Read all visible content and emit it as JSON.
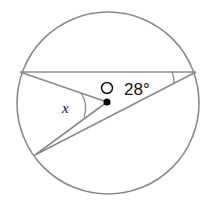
{
  "diagram": {
    "type": "circle-geometry",
    "center_label": "O",
    "angle_label": "28°",
    "unknown_label": "x",
    "colors": {
      "stroke": "#8a8a8a",
      "center_dot": "#000000",
      "text": "#111111"
    },
    "circle": {
      "cx": 108,
      "cy": 103,
      "r": 91
    },
    "points": {
      "A": {
        "x": 20,
        "y": 72
      },
      "B": {
        "x": 196,
        "y": 72
      },
      "C": {
        "x": 35,
        "y": 155
      },
      "O": {
        "x": 107,
        "y": 102
      }
    }
  }
}
